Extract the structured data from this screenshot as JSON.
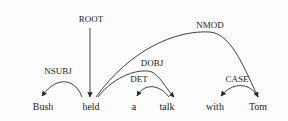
{
  "diagram": {
    "type": "dependency-parse",
    "words": [
      "Bush",
      "held",
      "a",
      "talk",
      "with",
      "Tom"
    ],
    "root": {
      "label": "ROOT",
      "target": 1
    },
    "arcs": [
      {
        "label": "NSUBJ",
        "head": 1,
        "dependent": 0
      },
      {
        "label": "NMOD",
        "head": 1,
        "dependent": 5
      },
      {
        "label": "DOBJ",
        "head": 1,
        "dependent": 3
      },
      {
        "label": "DET",
        "head": 3,
        "dependent": 2
      },
      {
        "label": "CASE",
        "head": 5,
        "dependent": 4
      }
    ]
  }
}
